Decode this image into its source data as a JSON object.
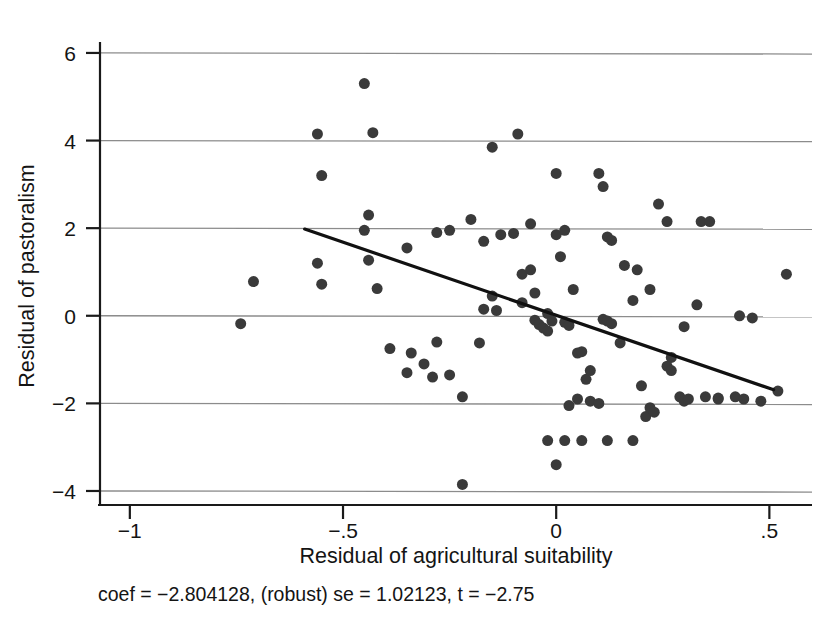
{
  "chart_data": {
    "type": "scatter",
    "title": "",
    "xlabel": "Residual of agricultural suitability",
    "ylabel": "Residual of pastoralism",
    "xlim": [
      -1.07,
      0.6
    ],
    "ylim": [
      -4.32,
      6.25
    ],
    "xticks": [
      -1,
      -0.5,
      0,
      0.5
    ],
    "xticklabels": [
      "−1",
      "−.5",
      "0",
      ".5"
    ],
    "yticks": [
      -4,
      -2,
      0,
      2,
      4,
      6
    ],
    "yticklabels": [
      "−4",
      "−2",
      "0",
      "2",
      "4",
      "6"
    ],
    "grid": "horizontal",
    "legend": "none",
    "marker": {
      "shape": "circle",
      "size": 11,
      "color": "#3a3a3a"
    },
    "annotation": "coef = −2.804128, (robust) se = 1.02123, t = −2.75",
    "fit_line": {
      "type": "linear",
      "color": "#111111",
      "width": 3.2,
      "slope": -2.804128,
      "x_start": -0.59,
      "y_start": 1.98,
      "x_end": 0.51,
      "y_end": -1.69
    },
    "series": [
      {
        "name": "observations",
        "points": [
          [
            -0.56,
            4.15
          ],
          [
            -0.45,
            5.3
          ],
          [
            -0.43,
            4.18
          ],
          [
            -0.55,
            3.2
          ],
          [
            -0.56,
            1.2
          ],
          [
            -0.55,
            0.72
          ],
          [
            -0.71,
            0.78
          ],
          [
            -0.74,
            -0.18
          ],
          [
            -0.44,
            2.3
          ],
          [
            -0.45,
            1.95
          ],
          [
            -0.44,
            1.27
          ],
          [
            -0.42,
            0.62
          ],
          [
            -0.39,
            -0.75
          ],
          [
            -0.34,
            -0.85
          ],
          [
            -0.35,
            -1.3
          ],
          [
            -0.28,
            -0.6
          ],
          [
            -0.29,
            -1.4
          ],
          [
            -0.31,
            -1.1
          ],
          [
            -0.25,
            -1.35
          ],
          [
            -0.22,
            -1.85
          ],
          [
            -0.22,
            -3.85
          ],
          [
            -0.28,
            1.9
          ],
          [
            -0.25,
            1.95
          ],
          [
            -0.2,
            2.2
          ],
          [
            -0.17,
            1.7
          ],
          [
            -0.15,
            0.45
          ],
          [
            -0.14,
            0.12
          ],
          [
            -0.17,
            0.15
          ],
          [
            -0.15,
            3.85
          ],
          [
            -0.09,
            4.15
          ],
          [
            -0.13,
            1.85
          ],
          [
            -0.1,
            1.88
          ],
          [
            -0.08,
            0.95
          ],
          [
            -0.08,
            0.3
          ],
          [
            -0.06,
            1.05
          ],
          [
            -0.05,
            0.52
          ],
          [
            -0.05,
            -0.1
          ],
          [
            -0.04,
            -0.2
          ],
          [
            -0.03,
            -0.28
          ],
          [
            -0.02,
            0.05
          ],
          [
            -0.02,
            -0.35
          ],
          [
            -0.01,
            -0.12
          ],
          [
            0.0,
            3.25
          ],
          [
            0.0,
            1.85
          ],
          [
            0.01,
            1.35
          ],
          [
            0.02,
            1.95
          ],
          [
            0.02,
            -0.15
          ],
          [
            0.03,
            -0.22
          ],
          [
            0.04,
            0.6
          ],
          [
            0.05,
            -0.85
          ],
          [
            0.06,
            -0.82
          ],
          [
            0.07,
            -1.45
          ],
          [
            0.08,
            -1.25
          ],
          [
            0.08,
            -1.95
          ],
          [
            0.1,
            3.25
          ],
          [
            0.11,
            2.95
          ],
          [
            0.12,
            1.8
          ],
          [
            0.13,
            1.72
          ],
          [
            0.11,
            -0.08
          ],
          [
            0.12,
            -0.12
          ],
          [
            0.13,
            -0.18
          ],
          [
            0.15,
            -0.62
          ],
          [
            0.05,
            -1.9
          ],
          [
            0.03,
            -2.05
          ],
          [
            0.1,
            -2.0
          ],
          [
            0.06,
            -2.85
          ],
          [
            0.12,
            -2.85
          ],
          [
            0.18,
            0.35
          ],
          [
            0.2,
            -1.6
          ],
          [
            0.21,
            -2.3
          ],
          [
            0.22,
            -2.1
          ],
          [
            0.23,
            -2.2
          ],
          [
            0.24,
            2.55
          ],
          [
            0.26,
            2.15
          ],
          [
            0.27,
            -0.95
          ],
          [
            0.26,
            -1.15
          ],
          [
            0.27,
            -1.25
          ],
          [
            0.29,
            -1.85
          ],
          [
            0.3,
            -1.95
          ],
          [
            0.31,
            -1.9
          ],
          [
            0.34,
            2.15
          ],
          [
            0.36,
            2.15
          ],
          [
            0.33,
            0.25
          ],
          [
            0.35,
            -1.85
          ],
          [
            0.38,
            -1.88
          ],
          [
            0.42,
            -1.85
          ],
          [
            0.44,
            -1.9
          ],
          [
            0.46,
            -0.05
          ],
          [
            0.43,
            0.0
          ],
          [
            0.54,
            0.95
          ],
          [
            0.52,
            -1.72
          ],
          [
            0.48,
            -1.95
          ],
          [
            -0.02,
            -2.85
          ],
          [
            0.02,
            -2.85
          ],
          [
            -0.0,
            -3.4
          ],
          [
            0.18,
            -2.85
          ],
          [
            -0.35,
            1.55
          ],
          [
            0.16,
            1.15
          ],
          [
            0.19,
            1.05
          ],
          [
            0.22,
            0.6
          ],
          [
            -0.06,
            2.1
          ],
          [
            0.3,
            -0.25
          ],
          [
            -0.18,
            -0.62
          ],
          [
            0.38,
            -1.9
          ]
        ]
      }
    ]
  },
  "axes": {
    "x_tick_labels": [
      "−1",
      "−.5",
      "0",
      ".5"
    ],
    "y_tick_labels": [
      "−4",
      "−2",
      "0",
      "2",
      "4",
      "6"
    ],
    "x_axis_title": "Residual of agricultural suitability",
    "y_axis_title": "Residual of pastoralism"
  },
  "caption": {
    "stats_line": "coef = −2.804128, (robust) se = 1.02123, t = −2.75"
  },
  "colors": {
    "marker": "#3a3a3a",
    "fit_line": "#111111",
    "gridline": "#8c8c8c",
    "axis": "#1a1a1a",
    "background": "#ffffff",
    "text": "#141414"
  }
}
